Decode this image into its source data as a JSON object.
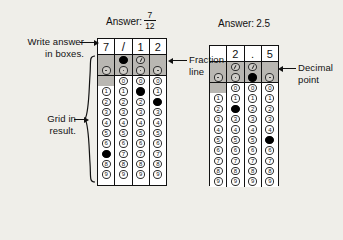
{
  "diagram": {
    "labels": {
      "write_answer": "Write answer\nin boxes.",
      "grid_in_result": "Grid in\nresult.",
      "fraction_line": "Fraction\nline",
      "decimal_point": "Decimal\npoint"
    },
    "digits": [
      "0",
      "1",
      "2",
      "3",
      "4",
      "5",
      "6",
      "7",
      "8",
      "9"
    ],
    "glyphs": {
      "slash": "/",
      "decimal": ".",
      "fraction_bubble": "slash-bubble",
      "decimal_bubble": "decimal-bubble"
    },
    "grids": [
      {
        "id": "fraction-grid",
        "answer_prefix": "Answer:",
        "answer_kind": "fraction",
        "answer_numerator": "7",
        "answer_denominator": "12",
        "answer_text": "7/12",
        "boxes": [
          "7",
          "/",
          "1",
          "2"
        ],
        "columns": [
          {
            "index": 0,
            "slash_bubble": "none",
            "decimal_bubble": "open",
            "has_zero": false,
            "filled_digit": "7"
          },
          {
            "index": 1,
            "slash_bubble": "filled",
            "decimal_bubble": "open",
            "has_zero": true,
            "filled_digit": null
          },
          {
            "index": 2,
            "slash_bubble": "open",
            "decimal_bubble": "open",
            "has_zero": true,
            "filled_digit": "1"
          },
          {
            "index": 3,
            "slash_bubble": "none",
            "decimal_bubble": "open",
            "has_zero": true,
            "filled_digit": "2"
          }
        ]
      },
      {
        "id": "decimal-grid",
        "answer_prefix": "Answer:",
        "answer_kind": "decimal",
        "answer_numerator": "",
        "answer_denominator": "",
        "answer_text": "2.5",
        "boxes": [
          "",
          "2",
          ".",
          "5"
        ],
        "columns": [
          {
            "index": 0,
            "slash_bubble": "none",
            "decimal_bubble": "open",
            "has_zero": false,
            "filled_digit": null
          },
          {
            "index": 1,
            "slash_bubble": "open",
            "decimal_bubble": "open",
            "has_zero": true,
            "filled_digit": "2"
          },
          {
            "index": 2,
            "slash_bubble": "open",
            "decimal_bubble": "filled",
            "has_zero": true,
            "filled_digit": null
          },
          {
            "index": 3,
            "slash_bubble": "none",
            "decimal_bubble": "open",
            "has_zero": true,
            "filled_digit": "5"
          }
        ]
      }
    ]
  },
  "colors": {
    "background": "#efeee9",
    "ink": "#111111",
    "shade": "#b9b7b2",
    "bubble_fill": "#000000"
  }
}
